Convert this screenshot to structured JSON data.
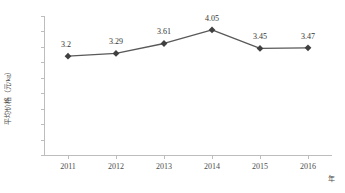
{
  "chart_data": {
    "type": "line",
    "title": "",
    "xlabel": "年",
    "ylabel": "平均价格（元/kg）",
    "categories": [
      "2011",
      "2012",
      "2013",
      "2014",
      "2015",
      "2016"
    ],
    "values": [
      3.2,
      3.29,
      3.61,
      4.05,
      3.45,
      3.47
    ],
    "data_labels": [
      "3.2",
      "3.29",
      "3.61",
      "4.05",
      "3.45",
      "3.47"
    ],
    "series": [
      {
        "name": "平均价格",
        "values": [
          3.2,
          3.29,
          3.61,
          4.05,
          3.45,
          3.47
        ]
      }
    ],
    "ylim": [
      0,
      4.5
    ],
    "ytick_labels": [
      "0",
      "0.5",
      "1",
      "1.5",
      "2",
      "2.5",
      "3",
      "3.5",
      "4",
      "4.5"
    ],
    "ytick_values": [
      0,
      0.5,
      1,
      1.5,
      2,
      2.5,
      3,
      3.5,
      4,
      4.5
    ],
    "grid": false,
    "legend": "none",
    "marker": "diamond",
    "line_color": "#595959",
    "marker_color": "#404040",
    "axis_color": "#bdbdbd",
    "text_color": "#4d4d4d"
  }
}
